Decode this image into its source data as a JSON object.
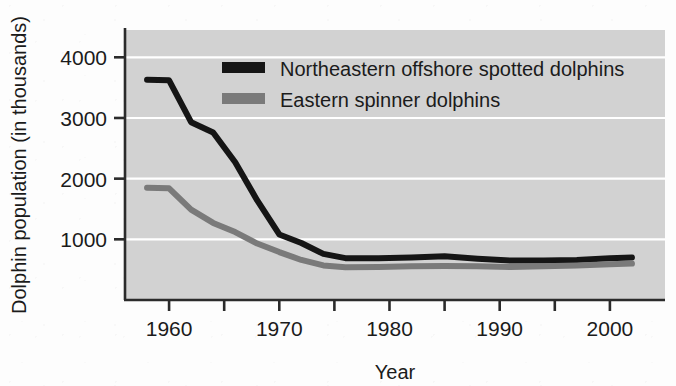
{
  "chart_data": {
    "type": "line",
    "title": "",
    "xlabel": "Year",
    "ylabel": "Dolphin population (in thousands)",
    "xlim": [
      1956,
      2005
    ],
    "ylim": [
      0,
      4450
    ],
    "grid": true,
    "grid_color": "#ffffff",
    "plot_background": "#d2d2d2",
    "legend_position": "top-right-inside",
    "xticks": [
      1960,
      1965,
      1970,
      1975,
      1980,
      1985,
      1990,
      1995,
      2000
    ],
    "xtick_labels": [
      "1960",
      "",
      "1970",
      "",
      "1980",
      "",
      "1990",
      "",
      "2000"
    ],
    "yticks": [
      1000,
      2000,
      3000,
      4000
    ],
    "ytick_labels": [
      "1000",
      "2000",
      "3000",
      "4000"
    ],
    "series": [
      {
        "name": "Northeastern offshore spotted dolphins",
        "color": "#151515",
        "width": 6,
        "x": [
          1958,
          1960,
          1962,
          1964,
          1966,
          1968,
          1970,
          1972,
          1974,
          1976,
          1979,
          1982,
          1985,
          1988,
          1991,
          1994,
          1997,
          2000,
          2002
        ],
        "values": [
          3630,
          3620,
          2930,
          2760,
          2270,
          1640,
          1080,
          940,
          760,
          690,
          690,
          700,
          720,
          680,
          650,
          650,
          660,
          690,
          700
        ]
      },
      {
        "name": "Eastern spinner dolphins",
        "color": "#7a7a7a",
        "width": 6,
        "x": [
          1958,
          1960,
          1962,
          1964,
          1966,
          1968,
          1970,
          1972,
          1974,
          1976,
          1979,
          1982,
          1985,
          1988,
          1991,
          1994,
          1997,
          2000,
          2002
        ],
        "values": [
          1850,
          1840,
          1490,
          1270,
          1120,
          930,
          790,
          660,
          570,
          540,
          545,
          555,
          560,
          555,
          545,
          555,
          570,
          590,
          600
        ]
      }
    ]
  },
  "legend": {
    "items": [
      {
        "label": "Northeastern offshore spotted dolphins",
        "color": "#151515"
      },
      {
        "label": "Eastern spinner dolphins",
        "color": "#7a7a7a"
      }
    ]
  }
}
